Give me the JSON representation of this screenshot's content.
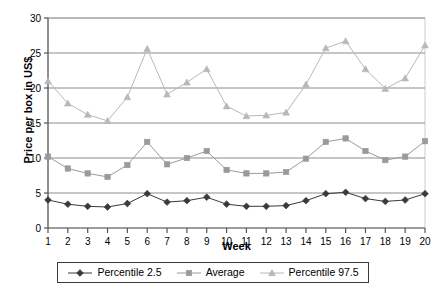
{
  "chart_data": {
    "type": "line",
    "title": "",
    "subtitle": "",
    "xlabel": "Week",
    "ylabel": "Price per box in US$",
    "x": [
      1,
      2,
      3,
      4,
      5,
      6,
      7,
      8,
      9,
      10,
      11,
      12,
      13,
      14,
      15,
      16,
      17,
      18,
      19,
      20
    ],
    "categories": [
      "1",
      "2",
      "3",
      "4",
      "5",
      "6",
      "7",
      "8",
      "9",
      "10",
      "11",
      "12",
      "13",
      "14",
      "15",
      "16",
      "17",
      "18",
      "19",
      "20"
    ],
    "xlim": [
      1,
      20
    ],
    "ylim": [
      0,
      30
    ],
    "yticks": [
      0,
      5,
      10,
      15,
      20,
      25,
      30
    ],
    "ytick_labels": [
      "0",
      "5",
      "10",
      "15",
      "20",
      "25",
      "30"
    ],
    "grid": true,
    "grid_axis": "y",
    "legend_position": "bottom",
    "series": [
      {
        "name": "Percentile 2.5",
        "marker": "diamond",
        "color": "#3a3a3a",
        "values": [
          4.0,
          3.4,
          3.1,
          3.0,
          3.5,
          4.9,
          3.7,
          3.9,
          4.4,
          3.4,
          3.1,
          3.1,
          3.2,
          3.9,
          4.9,
          5.1,
          4.2,
          3.8,
          4.0,
          4.9
        ]
      },
      {
        "name": "Average",
        "marker": "square",
        "color": "#9a9a9a",
        "values": [
          10.2,
          8.5,
          7.8,
          7.3,
          9.0,
          12.3,
          9.1,
          10.0,
          11.0,
          8.3,
          7.8,
          7.8,
          8.0,
          9.9,
          12.3,
          12.8,
          11.0,
          9.7,
          10.2,
          12.4
        ]
      },
      {
        "name": "Percentile 97.5",
        "marker": "triangle",
        "color": "#b8b8b8",
        "values": [
          21.0,
          17.8,
          16.2,
          15.3,
          18.7,
          25.6,
          19.1,
          20.8,
          22.7,
          17.4,
          16.0,
          16.1,
          16.5,
          20.5,
          25.7,
          26.7,
          22.7,
          19.9,
          21.4,
          26.1
        ]
      }
    ]
  },
  "axes": {
    "x_title": "Week",
    "y_title": "Price per box in US$"
  },
  "legend": {
    "items": [
      {
        "label": "Percentile 2.5"
      },
      {
        "label": "Average"
      },
      {
        "label": "Percentile 97.5"
      }
    ]
  },
  "colors": {
    "percentile_low": "#3a3a3a",
    "average": "#9a9a9a",
    "percentile_high": "#b8b8b8",
    "grid": "#8c8c8c",
    "axis": "#555555",
    "background": "#ffffff"
  }
}
